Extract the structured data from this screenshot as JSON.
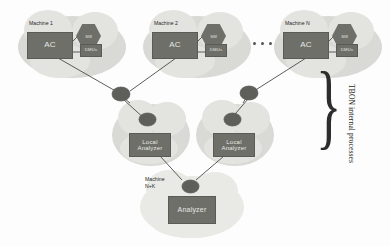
{
  "diagram": {
    "machines": [
      {
        "label": "Machine 1",
        "ac_label": "AC",
        "hex_label": "SW",
        "dmu_label": "DMUs"
      },
      {
        "label": "Machine 2",
        "ac_label": "AC",
        "hex_label": "SW",
        "dmu_label": "DMUs"
      },
      {
        "label": "Machine N",
        "ac_label": "AC",
        "hex_label": "SW",
        "dmu_label": "DMUs"
      }
    ],
    "ellipsis": "...",
    "local_analyzers": [
      {
        "label": "Local\nAnalyzer"
      },
      {
        "label": "Local\nAnalyzer"
      }
    ],
    "local_analyzer_label": "Local Analyzer",
    "root": {
      "machine_label": "Machine\nN+K",
      "box_label": "Analyzer"
    },
    "annotation": {
      "brace": "}",
      "text": "TBON internal processes"
    },
    "colors": {
      "box_fill": "#6e6f69",
      "node_fill": "#5e5f5a",
      "cloud_fill": "#d9dad6",
      "cloud_light": "#e3e4e0",
      "text_on_box": "#e8e8e4",
      "label_text": "#2a2a28",
      "wire": "#4a4b47",
      "background": "#fdfdfd"
    }
  }
}
